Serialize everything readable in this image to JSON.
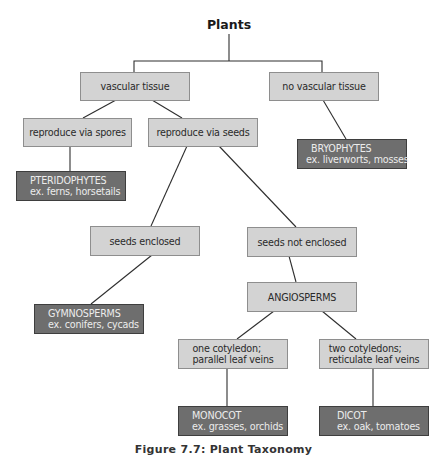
{
  "diagram": {
    "title": "Plants",
    "caption": "Figure 7.7: Plant Taxonomy",
    "colors": {
      "decision_fill": "#d3d3d3",
      "decision_border": "#8e8e8e",
      "group_fill": "#6e6e6e",
      "group_text": "#ececec",
      "connector": "#2e2e2e"
    },
    "nodes": {
      "vascular": {
        "label": "vascular tissue"
      },
      "no_vascular": {
        "label": "no vascular tissue"
      },
      "spores": {
        "label": "reproduce via spores"
      },
      "seeds": {
        "label": "reproduce via seeds"
      },
      "bryophytes": {
        "name": "BRYOPHYTES",
        "examples": "ex. liverworts, mosses"
      },
      "pteridophytes": {
        "name": "PTERIDOPHYTES",
        "examples": "ex. ferns, horsetails"
      },
      "seeds_enclosed": {
        "label": "seeds enclosed"
      },
      "seeds_not_enclosed": {
        "label": "seeds not enclosed"
      },
      "angiosperms": {
        "label": "ANGIOSPERMS"
      },
      "gymnosperms": {
        "name": "GYMNOSPERMS",
        "examples": "ex. conifers, cycads"
      },
      "one_cotyledon": {
        "line1": "one cotyledon;",
        "line2": "parallel leaf veins"
      },
      "two_cotyledons": {
        "line1": "two cotyledons;",
        "line2": "reticulate leaf veins"
      },
      "monocot": {
        "name": "MONOCOT",
        "examples": "ex. grasses, orchids"
      },
      "dicot": {
        "name": "DICOT",
        "examples": "ex. oak, tomatoes"
      }
    },
    "edges": [
      [
        "Plants",
        "vascular tissue"
      ],
      [
        "Plants",
        "no vascular tissue"
      ],
      [
        "vascular tissue",
        "reproduce via spores"
      ],
      [
        "vascular tissue",
        "reproduce via seeds"
      ],
      [
        "no vascular tissue",
        "BRYOPHYTES"
      ],
      [
        "reproduce via spores",
        "PTERIDOPHYTES"
      ],
      [
        "reproduce via seeds",
        "seeds enclosed"
      ],
      [
        "reproduce via seeds",
        "seeds not enclosed"
      ],
      [
        "seeds enclosed",
        "GYMNOSPERMS"
      ],
      [
        "seeds not enclosed",
        "ANGIOSPERMS"
      ],
      [
        "ANGIOSPERMS",
        "one cotyledon; parallel leaf veins"
      ],
      [
        "ANGIOSPERMS",
        "two cotyledons; reticulate leaf veins"
      ],
      [
        "one cotyledon; parallel leaf veins",
        "MONOCOT"
      ],
      [
        "two cotyledons; reticulate leaf veins",
        "DICOT"
      ]
    ]
  }
}
